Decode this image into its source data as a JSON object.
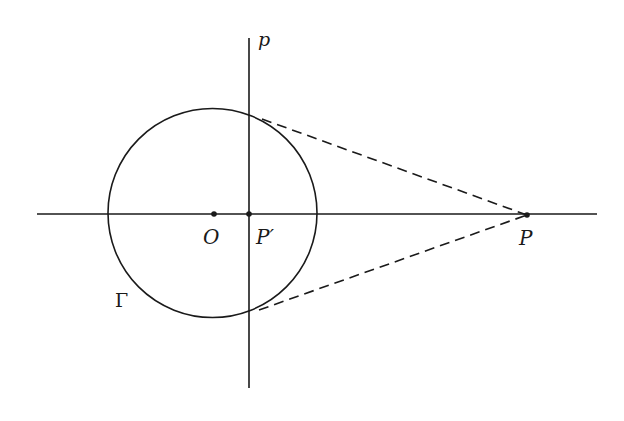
{
  "diagram": {
    "colors": {
      "stroke": "#1a1a1a",
      "background": "#ffffff"
    },
    "labels": {
      "line_p": "p",
      "center_O": "O",
      "point_P_prime": "P′",
      "point_P": "P",
      "circle_Gamma": "Γ"
    },
    "elements": {
      "horizontal_axis": {
        "x1": 37,
        "y1": 214,
        "x2": 597,
        "y2": 214
      },
      "polar_line_p": {
        "x1": 249,
        "y1": 38,
        "x2": 249,
        "y2": 388
      },
      "circle": {
        "cx": 212.5,
        "cy": 213,
        "r": 104.5
      },
      "point_O": {
        "x": 214,
        "y": 214
      },
      "point_P_prime": {
        "x": 249,
        "y": 214
      },
      "point_P": {
        "x": 527,
        "y": 215
      },
      "tangent_upper": {
        "x1": 262,
        "y1": 119,
        "x2": 527,
        "y2": 215,
        "style": "dashed"
      },
      "tangent_lower": {
        "x1": 259,
        "y1": 310,
        "x2": 527,
        "y2": 215,
        "style": "dashed"
      }
    }
  }
}
